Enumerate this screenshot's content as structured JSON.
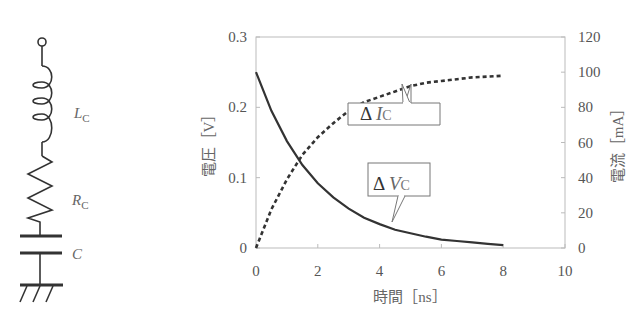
{
  "circuit": {
    "inductor_label": "L",
    "inductor_sub": "C",
    "resistor_label": "R",
    "resistor_sub": "C",
    "capacitor_label": "C"
  },
  "chart_data": {
    "type": "line",
    "title": "",
    "xlabel": "時間［ns］",
    "ylabel_left": "電圧［V］",
    "ylabel_right": "電流［mA］",
    "xlim": [
      0,
      10
    ],
    "ylim_left": [
      0,
      0.3
    ],
    "ylim_right": [
      0,
      120
    ],
    "xticks": [
      "0",
      "2",
      "4",
      "6",
      "8",
      "10"
    ],
    "yticks_left": [
      "0",
      "0.1",
      "0.2",
      "0.3"
    ],
    "yticks_right": [
      "0",
      "20",
      "40",
      "60",
      "80",
      "100",
      "120"
    ],
    "grid": false,
    "series": [
      {
        "name": "ΔVC",
        "axis": "left",
        "style": "solid",
        "x": [
          0,
          0.5,
          1,
          1.5,
          2,
          2.5,
          3,
          3.5,
          4,
          4.5,
          5,
          5.5,
          6,
          6.5,
          7,
          7.5,
          8
        ],
        "values": [
          0.25,
          0.195,
          0.152,
          0.118,
          0.092,
          0.072,
          0.056,
          0.043,
          0.034,
          0.026,
          0.021,
          0.016,
          0.012,
          0.01,
          0.008,
          0.006,
          0.004
        ]
      },
      {
        "name": "ΔIC",
        "axis": "right",
        "style": "dotted",
        "x": [
          0,
          0.5,
          1,
          1.5,
          2,
          2.5,
          3,
          3.5,
          4,
          4.5,
          5,
          5.5,
          6,
          6.5,
          7,
          7.5,
          8
        ],
        "values": [
          0,
          22,
          39,
          53,
          63,
          71,
          78,
          83,
          86,
          89,
          92,
          94,
          95,
          96,
          97,
          97.5,
          98
        ]
      }
    ],
    "annotations": [
      {
        "text_main": "Δ ",
        "text_var": "V",
        "text_sub": "C",
        "points_to": [
          5.0,
          0.021
        ]
      },
      {
        "text_main": "Δ ",
        "text_var": "I",
        "text_sub": "C",
        "points_to": [
          5.6,
          94
        ]
      }
    ]
  }
}
